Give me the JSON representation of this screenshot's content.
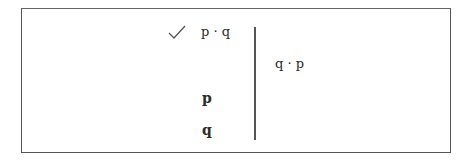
{
  "diagram": {
    "type": "truth-tree-derivation",
    "left_column": {
      "premise": {
        "text": "p · q",
        "checked": true,
        "check_icon": "check-icon"
      },
      "derived": [
        {
          "text": "p",
          "bold": true
        },
        {
          "text": "q",
          "bold": true
        }
      ]
    },
    "right_column": {
      "negated_conclusion": {
        "text": "q · p"
      }
    },
    "colors": {
      "line": "#555555",
      "text": "#2a2a2a",
      "background": "#ffffff"
    }
  }
}
